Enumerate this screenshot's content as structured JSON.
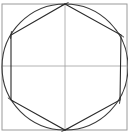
{
  "diagram": {
    "title": "",
    "type": "geometric-construction",
    "colors": {
      "background": "#ffffff",
      "frame": "#9a9a9a",
      "construction": "#a0a0a0",
      "circle": "#3a3a3a",
      "hexagon": "#2a2a2a",
      "ticks": "#2a2a2a"
    },
    "frame": {
      "x": 2,
      "y": 4,
      "width": 125,
      "height": 126
    },
    "center": {
      "x": 65,
      "y": 67
    },
    "circle": {
      "cx": 65,
      "cy": 67,
      "r": 63
    },
    "axes": {
      "vertical": {
        "x": 65,
        "y1": 4,
        "y2": 130
      },
      "horizontal": {
        "y": 66,
        "x1": 2,
        "x2": 127
      }
    },
    "hexagon_vertices": [
      {
        "name": "top",
        "x": 65,
        "y": 4
      },
      {
        "name": "upper-right",
        "x": 121,
        "y": 35
      },
      {
        "name": "lower-right",
        "x": 120,
        "y": 100
      },
      {
        "name": "bottom",
        "x": 65,
        "y": 130
      },
      {
        "name": "lower-left",
        "x": 11,
        "y": 100
      },
      {
        "name": "upper-left",
        "x": 11,
        "y": 35
      }
    ]
  }
}
